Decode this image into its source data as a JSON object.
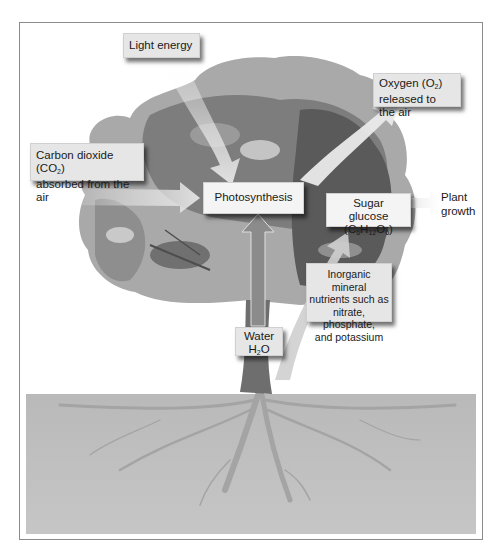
{
  "diagram": {
    "labels": {
      "light_energy": "Light energy",
      "oxygen_line1_pre": "Oxygen (O",
      "oxygen_line1_sub": "2",
      "oxygen_line1_post": ")",
      "oxygen_line2": "released to the air",
      "co2_line1_pre": "Carbon dioxide (CO",
      "co2_line1_sub": "2",
      "co2_line1_post": ")",
      "co2_line2": "absorbed from the air",
      "photosynthesis": "Photosynthesis",
      "sugar_line1": "Sugar glucose",
      "sugar_formula": {
        "c": "(C",
        "c_sub": "6",
        "h": "H",
        "h_sub": "12",
        "o": "O",
        "o_sub": "6",
        "close": ")"
      },
      "plant_growth_line1": "Plant",
      "plant_growth_line2": "growth",
      "minerals_line1": "Inorganic mineral",
      "minerals_line2": "nutrients such as",
      "minerals_line3": "nitrate, phosphate,",
      "minerals_line4": "and potassium",
      "water_line1": "Water",
      "water_h": "H",
      "water_sub": "2",
      "water_o": "O"
    },
    "colors": {
      "frame_border": "#8a8a8a",
      "ground": "#bdbdbd",
      "foliage_light": "#a9a9a9",
      "foliage_mid": "#7d7d7d",
      "foliage_dark": "#555555",
      "trunk": "#6e6e6e",
      "arrow": "#e8e8e8",
      "label_bg": "#e6e6e6"
    }
  }
}
